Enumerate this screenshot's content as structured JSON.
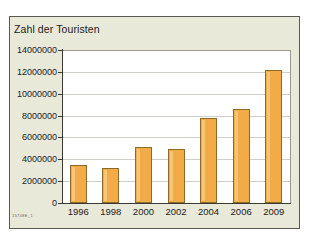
{
  "panel": {
    "background_color": "#e9e9da",
    "border_color": "#5a5a52"
  },
  "source_id": "15748E_1",
  "chart_data": {
    "type": "bar",
    "title": "Zahl der Touristen",
    "xlabel": "",
    "ylabel": "",
    "categories": [
      "1996",
      "1998",
      "2000",
      "2002",
      "2004",
      "2006",
      "2009"
    ],
    "values": [
      3500000,
      3200000,
      5100000,
      4900000,
      7800000,
      8600000,
      12200000
    ],
    "ylim": [
      0,
      14000000
    ],
    "ytick_labels": [
      "0",
      "2000000",
      "4000000",
      "6000000",
      "8000000",
      "10000000",
      "12000000",
      "14000000"
    ],
    "ytick_values": [
      0,
      2000000,
      4000000,
      6000000,
      8000000,
      10000000,
      12000000,
      14000000
    ],
    "grid": true,
    "legend": "none",
    "bar_color": "#f2ab47",
    "bar_border_color": "#8c6a28",
    "plot_background": "#ffffff",
    "axis_color": "#3a3a34",
    "gridline_color": "#cfcfc8"
  }
}
